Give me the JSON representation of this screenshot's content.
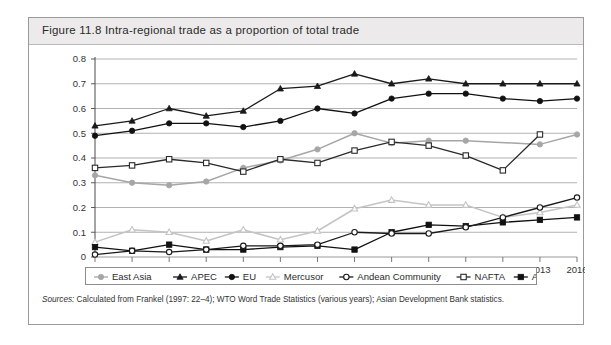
{
  "figure": {
    "title": "Figure 11.8  Intra-regional trade as a proportion of total trade",
    "sources_label": "Sources:",
    "sources_text": "Calculated from Frankel (1997: 22–4); WTO Word Trade Statistics (various years); Asian Development Bank statistics."
  },
  "chart_data": {
    "type": "line",
    "title": "Intra-regional trade as a proportion of total trade",
    "xlabel": "",
    "ylabel": "",
    "ylim": [
      0,
      0.8
    ],
    "yticks": [
      "0",
      "0.1",
      "0.2",
      "0.3",
      "0.4",
      "0.5",
      "0.6",
      "0.7",
      "0.8"
    ],
    "ytick_values": [
      0,
      0.1,
      0.2,
      0.3,
      0.4,
      0.5,
      0.6,
      0.7,
      0.8
    ],
    "grid": true,
    "legend_position": "bottom",
    "categories": [
      "1962",
      "1965",
      "1970",
      "1975",
      "1980",
      "1985",
      "1990",
      "1994",
      "1998",
      "2000",
      "2005",
      "2010",
      "2013",
      "2016"
    ],
    "series": [
      {
        "name": "East Asia",
        "marker": "circle-filled",
        "color": "#a6a6a6",
        "values": [
          0.33,
          0.3,
          0.29,
          0.305,
          0.36,
          0.39,
          0.435,
          0.5,
          0.46,
          0.47,
          0.47,
          null,
          0.455,
          0.495
        ]
      },
      {
        "name": "APEC",
        "marker": "triangle-filled",
        "color": "#1a1a1a",
        "values": [
          0.53,
          0.55,
          0.6,
          0.57,
          0.59,
          0.68,
          0.69,
          0.74,
          0.7,
          0.72,
          0.7,
          0.7,
          0.7,
          0.7
        ]
      },
      {
        "name": "EU",
        "marker": "circle-filled",
        "color": "#111111",
        "values": [
          0.49,
          0.51,
          0.54,
          0.54,
          0.525,
          0.55,
          0.6,
          0.58,
          0.64,
          0.66,
          0.66,
          0.64,
          0.63,
          0.64
        ]
      },
      {
        "name": "Mercusor",
        "marker": "triangle-open",
        "color": "#c4c4c4",
        "values": [
          0.06,
          0.11,
          0.1,
          0.065,
          0.11,
          0.07,
          0.105,
          0.195,
          0.23,
          0.21,
          0.21,
          0.16,
          0.18,
          0.21
        ]
      },
      {
        "name": "Andean Community",
        "marker": "circle-open",
        "color": "#1a1a1a",
        "values": [
          0.01,
          0.025,
          0.02,
          0.03,
          0.045,
          0.045,
          0.05,
          0.1,
          0.095,
          0.095,
          0.12,
          0.16,
          0.2,
          0.24
        ]
      },
      {
        "name": "NAFTA",
        "marker": "square-open",
        "color": "#2b2b2b",
        "values": [
          0.36,
          0.37,
          0.395,
          0.38,
          0.345,
          0.395,
          0.38,
          0.43,
          0.465,
          0.45,
          0.41,
          0.35,
          0.495,
          null
        ]
      },
      {
        "name": "Africa",
        "marker": "square-filled",
        "color": "#111111",
        "values": [
          0.04,
          0.025,
          0.05,
          0.03,
          0.03,
          0.04,
          0.045,
          0.03,
          0.1,
          0.13,
          0.125,
          0.14,
          0.15,
          0.16
        ]
      }
    ]
  },
  "legend": {
    "entries": [
      {
        "label": "East Asia",
        "marker": "circle-filled",
        "color": "#a6a6a6"
      },
      {
        "label": "APEC",
        "marker": "triangle-filled",
        "color": "#1a1a1a"
      },
      {
        "label": "EU",
        "marker": "circle-filled",
        "color": "#111111"
      },
      {
        "label": "Mercusor",
        "marker": "triangle-open",
        "color": "#c4c4c4"
      },
      {
        "label": "Andean Community",
        "marker": "circle-open",
        "color": "#1a1a1a"
      },
      {
        "label": "NAFTA",
        "marker": "square-open",
        "color": "#2b2b2b"
      },
      {
        "label": "Africa",
        "marker": "square-filled",
        "color": "#111111"
      }
    ]
  }
}
